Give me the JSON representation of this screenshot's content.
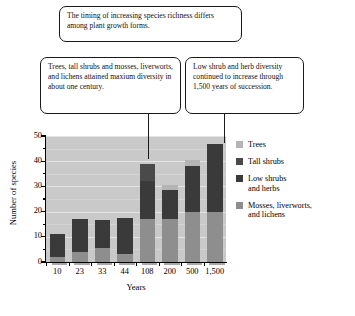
{
  "callouts": [
    {
      "id": "top",
      "text": "The timing of increasing species richness differs among plant growth forms."
    },
    {
      "id": "left",
      "text": "Trees, tall shrubs and mosses, liverworts, and lichens attained maxium diversity in about one century."
    },
    {
      "id": "right",
      "text": "Low shrub and herb diversity continued to increase through 1,500 years of succession."
    }
  ],
  "legend": [
    {
      "label": "Trees",
      "swatch": "trees",
      "color": "#b4b4b4"
    },
    {
      "label": "Tall shrubs",
      "swatch": "tall",
      "color": "#4a4a4a"
    },
    {
      "label": "Low shrubs\nand herbs",
      "swatch": "low",
      "color": "#3a3a3a"
    },
    {
      "label": "Mosses, liverworts,\nand lichens",
      "swatch": "moss",
      "color": "#8e8e8e"
    }
  ],
  "axis": {
    "y_ticks": [
      "0",
      "10",
      "20",
      "30",
      "40",
      "50"
    ],
    "x_labels": [
      "10",
      "23",
      "33",
      "44",
      "108",
      "200",
      "500",
      "1,500"
    ]
  },
  "chart_data": {
    "type": "bar",
    "subtype": "stacked-bar",
    "title": "",
    "xlabel": "Years",
    "ylabel": "Number of species",
    "ylim": [
      0,
      50
    ],
    "ytick_step": 10,
    "grid": true,
    "legend_position": "right",
    "categories": [
      "10",
      "23",
      "33",
      "44",
      "108",
      "200",
      "500",
      "1,500"
    ],
    "series": [
      {
        "name": "Mosses, liverworts, and lichens",
        "color": "#8e8e8e",
        "values": [
          2,
          4,
          5.5,
          3,
          17,
          17,
          20,
          20
        ]
      },
      {
        "name": "Low shrubs and herbs",
        "color": "#3a3a3a",
        "values": [
          9,
          13,
          11,
          14.5,
          15,
          11.5,
          18,
          27
        ]
      },
      {
        "name": "Tall shrubs",
        "color": "#4a4a4a",
        "values": [
          0,
          0,
          0,
          0,
          7,
          0,
          0,
          0
        ]
      },
      {
        "name": "Trees",
        "color": "#b4b4b4",
        "values": [
          0,
          0,
          0,
          0,
          0,
          2,
          2.5,
          0
        ]
      }
    ],
    "totals": [
      11,
      17,
      16.5,
      17.5,
      39,
      30.5,
      40.5,
      47
    ]
  }
}
